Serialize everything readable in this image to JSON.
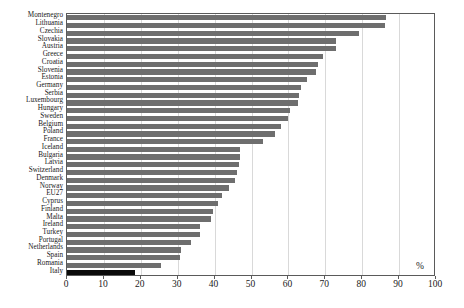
{
  "chart_data": {
    "type": "bar",
    "orientation": "horizontal",
    "title": "",
    "subtitle": "",
    "xlabel": "%",
    "ylabel": "",
    "xlim": [
      0,
      100
    ],
    "xticks": [
      0,
      10,
      20,
      30,
      40,
      50,
      60,
      70,
      80,
      90,
      100
    ],
    "grid": true,
    "legend": null,
    "categories": [
      "Montenegro",
      "Lithuania",
      "Czechia",
      "Slovakia",
      "Austria",
      "Greece",
      "Croatia",
      "Slovenia",
      "Estonia",
      "Germany",
      "Serbia",
      "Luxembourg",
      "Hungary",
      "Sweden",
      "Belgium",
      "Poland",
      "France",
      "Iceland",
      "Bulgaria",
      "Latvia",
      "Switzerland",
      "Denmark",
      "Norway",
      "EU27",
      "Cyprus",
      "Finland",
      "Malta",
      "Ireland",
      "Turkey",
      "Portugal",
      "Netherlands",
      "Spain",
      "Romania",
      "Italy"
    ],
    "values": [
      86.5,
      86.3,
      79.0,
      73.0,
      73.0,
      69.5,
      68.0,
      67.5,
      65.0,
      63.5,
      63.0,
      62.5,
      60.5,
      60.0,
      58.0,
      56.5,
      53.0,
      47.0,
      47.0,
      46.5,
      46.0,
      45.5,
      44.0,
      42.0,
      41.0,
      39.5,
      39.0,
      36.0,
      36.0,
      33.5,
      31.0,
      30.5,
      25.5,
      18.5
    ],
    "highlight_category": "Italy",
    "colors": {
      "bar": "#6e6e6e",
      "bar_highlight": "#0a0a0a",
      "grid": "#d9d9d9",
      "axis": "#5a5a5a",
      "text": "#1a1a1a",
      "background": "#ffffff"
    }
  }
}
